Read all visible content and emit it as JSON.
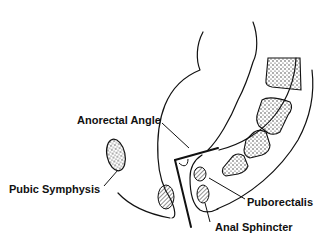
{
  "diagram": {
    "type": "anatomical line drawing",
    "labels": {
      "anorectal_angle": "Anorectal Angle",
      "pubic_symphysis": "Pubic Symphysis",
      "puborectalis": "Puborectalis",
      "anal_sphincter": "Anal Sphincter"
    },
    "colors": {
      "line": "#111111",
      "background": "#ffffff"
    }
  }
}
